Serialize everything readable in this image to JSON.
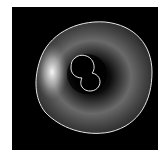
{
  "image": {
    "description": "Grayscale ring-shaped structure on black background with outer and inner segmentation contours",
    "background_color": "#000000",
    "page_color": "#ffffff",
    "contour_color": "#e8e8e8",
    "outer_contour": {
      "cx": 93,
      "cy": 77,
      "rx": 60,
      "ry": 56
    },
    "inner_contour_lobes": [
      {
        "cx": 82,
        "cy": 66,
        "r": 12
      },
      {
        "cx": 92,
        "cy": 82,
        "r": 10
      }
    ],
    "highlight": {
      "cx": 50,
      "cy": 72,
      "color": "#ffffff"
    }
  }
}
